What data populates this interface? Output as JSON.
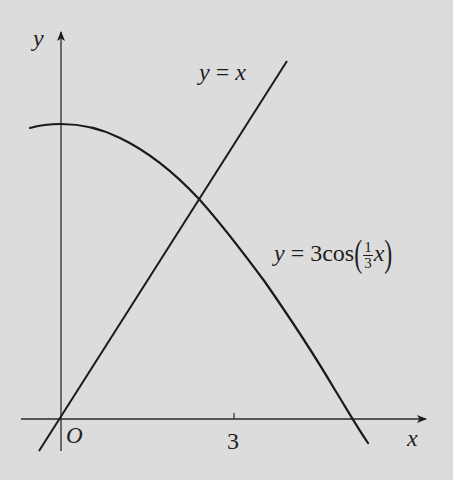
{
  "figure": {
    "background_color": "#dcdcdc",
    "stroke_color": "#1e1e1e",
    "axes": {
      "x_label": "x",
      "y_label": "y",
      "origin_label": "O",
      "x_ticks": [
        {
          "value": 3,
          "label": "3"
        }
      ]
    },
    "curves": [
      {
        "name": "line",
        "equation_parts": {
          "lhs": "y",
          "eq": "=",
          "rhs": "x"
        },
        "label": "y = x"
      },
      {
        "name": "cosine",
        "equation_parts": {
          "lhs": "y",
          "eq": "=",
          "coef": "3",
          "func": "cos",
          "frac_num": "1",
          "frac_den": "3",
          "var": "x"
        },
        "label": "y = 3cos(1/3 x)"
      }
    ],
    "intersection_label": ""
  }
}
